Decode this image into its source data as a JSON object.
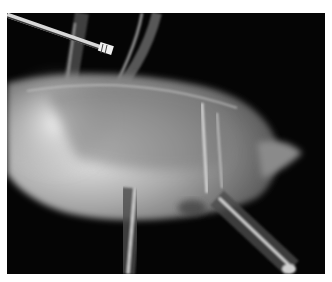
{
  "image": {
    "kind": "radiograph",
    "subject": "bird-lateral-xray",
    "background_color": "#050505",
    "border_color": "#ffffff"
  }
}
